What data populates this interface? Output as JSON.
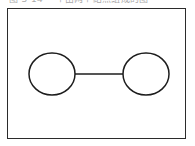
{
  "figure": {
    "caption": "图 3-14  一个由两个结点组成的图",
    "frame": {
      "x": 7,
      "y": 8,
      "width": 179,
      "height": 131,
      "border_color": "#2b2b2b",
      "background": "#ffffff"
    },
    "stroke_color": "#1d1d1d",
    "fill_color": "#ffffff"
  },
  "diagram_data": {
    "type": "graph",
    "node_count": 2,
    "edge_count": 1,
    "nodes": [
      {
        "id": "node-left",
        "label": "",
        "shape": "ellipse",
        "cx": 44,
        "cy": 65,
        "rx": 23,
        "ry": 21
      },
      {
        "id": "node-right",
        "label": "",
        "shape": "ellipse",
        "cx": 138,
        "cy": 65,
        "rx": 23,
        "ry": 21
      }
    ],
    "edges": [
      {
        "id": "edge-left-right",
        "from": "node-left",
        "to": "node-right",
        "label": "",
        "directed": false,
        "x1": 67,
        "y1": 65,
        "x2": 115,
        "y2": 65
      }
    ]
  }
}
